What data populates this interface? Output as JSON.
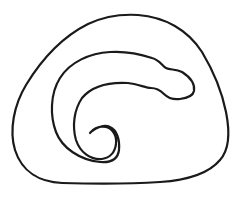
{
  "figure": {
    "description": "Line drawing of a closed rounded-triangular outline enclosing a spiral that curls into a hook at its center",
    "background_color": "#ffffff",
    "stroke_color": "#1a1a1a",
    "shapes": [
      {
        "name": "outer-loop",
        "kind": "closed-curve"
      },
      {
        "name": "spiral",
        "kind": "open-curve"
      }
    ]
  }
}
